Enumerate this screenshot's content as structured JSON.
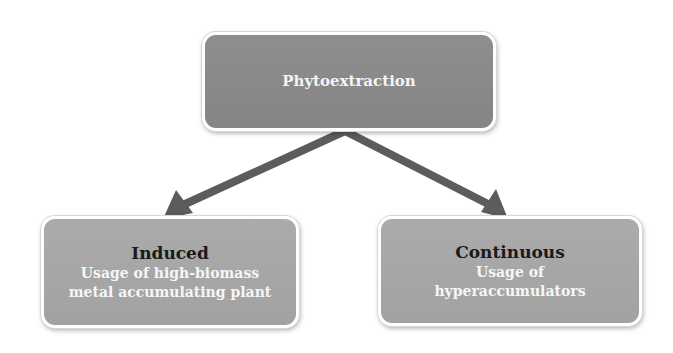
{
  "diagram": {
    "root": {
      "label": "Phytoextraction"
    },
    "children": [
      {
        "heading": "Induced",
        "description_lines": [
          "Usage of high-biomass",
          "metal accumulating plant"
        ]
      },
      {
        "heading": "Continuous",
        "description_lines": [
          "Usage of",
          "hyperaccumulators"
        ]
      }
    ],
    "edges": [
      {
        "from": "Phytoextraction",
        "to": "Induced"
      },
      {
        "from": "Phytoextraction",
        "to": "Continuous"
      }
    ]
  },
  "colors": {
    "root_fill": "#8a8a8a",
    "child_fill": "#a8a8a8",
    "arrow": "#5c5c5c",
    "heading_text": "#1a1a1a",
    "desc_text": "#f6f6f6",
    "border": "#ffffff"
  }
}
